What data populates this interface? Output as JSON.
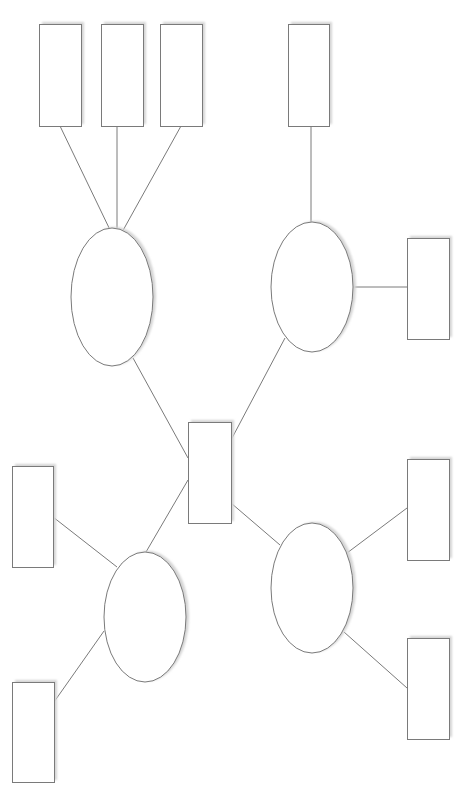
{
  "diagram": {
    "type": "hierarchical-mind-map",
    "labels": "none",
    "colors": {
      "stroke": "#7a7a7a",
      "fill": "#ffffff",
      "shadow": "#d4d4d4",
      "background": "#ffffff"
    },
    "center": {
      "id": "center-box",
      "x": 188,
      "y": 422,
      "w": 43,
      "h": 101
    },
    "ellipses": [
      {
        "id": "ellipse-top-left",
        "cx": 112,
        "cy": 297,
        "rx": 41,
        "ry": 69
      },
      {
        "id": "ellipse-top-right",
        "cx": 312,
        "cy": 287,
        "rx": 41,
        "ry": 65
      },
      {
        "id": "ellipse-bottom-left",
        "cx": 145,
        "cy": 617,
        "rx": 41,
        "ry": 65
      },
      {
        "id": "ellipse-bottom-right",
        "cx": 312,
        "cy": 588,
        "rx": 41,
        "ry": 65
      }
    ],
    "boxes": [
      {
        "id": "box-top-left-1",
        "x": 39,
        "y": 24,
        "w": 42,
        "h": 102
      },
      {
        "id": "box-top-left-2",
        "x": 101,
        "y": 24,
        "w": 42,
        "h": 102
      },
      {
        "id": "box-top-left-3",
        "x": 160,
        "y": 24,
        "w": 42,
        "h": 102
      },
      {
        "id": "box-top-right-1",
        "x": 288,
        "y": 24,
        "w": 41,
        "h": 102
      },
      {
        "id": "box-top-right-2",
        "x": 407,
        "y": 238,
        "w": 42,
        "h": 101
      },
      {
        "id": "box-bottom-left-1",
        "x": 12,
        "y": 466,
        "w": 41,
        "h": 101
      },
      {
        "id": "box-bottom-left-2",
        "x": 12,
        "y": 682,
        "w": 42,
        "h": 100
      },
      {
        "id": "box-bottom-right-1",
        "x": 407,
        "y": 459,
        "w": 42,
        "h": 101
      },
      {
        "id": "box-bottom-right-2",
        "x": 407,
        "y": 638,
        "w": 42,
        "h": 101
      }
    ],
    "connectors": [
      {
        "id": "line-tl1",
        "x1": 60,
        "y1": 126,
        "x2": 112,
        "y2": 234
      },
      {
        "id": "line-tl2",
        "x1": 117,
        "y1": 126,
        "x2": 117,
        "y2": 232
      },
      {
        "id": "line-tl3",
        "x1": 181,
        "y1": 126,
        "x2": 121,
        "y2": 234
      },
      {
        "id": "line-tl-center",
        "x1": 133,
        "y1": 358,
        "x2": 188,
        "y2": 458
      },
      {
        "id": "line-tr1",
        "x1": 311,
        "y1": 126,
        "x2": 311,
        "y2": 222
      },
      {
        "id": "line-tr2",
        "x1": 353,
        "y1": 287,
        "x2": 407,
        "y2": 287
      },
      {
        "id": "line-tr-center",
        "x1": 285,
        "y1": 338,
        "x2": 231,
        "y2": 440
      },
      {
        "id": "line-bl1",
        "x1": 53,
        "y1": 517,
        "x2": 117,
        "y2": 567
      },
      {
        "id": "line-bl2",
        "x1": 104,
        "y1": 631,
        "x2": 54,
        "y2": 702
      },
      {
        "id": "line-bl-center",
        "x1": 146,
        "y1": 552,
        "x2": 188,
        "y2": 480
      },
      {
        "id": "line-br1",
        "x1": 347,
        "y1": 553,
        "x2": 407,
        "y2": 508
      },
      {
        "id": "line-br2",
        "x1": 344,
        "y1": 632,
        "x2": 407,
        "y2": 688
      },
      {
        "id": "line-br-center",
        "x1": 231,
        "y1": 503,
        "x2": 280,
        "y2": 545
      }
    ]
  }
}
